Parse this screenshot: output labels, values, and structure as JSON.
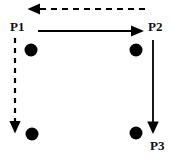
{
  "figure": {
    "background_color": "#ffffff",
    "stroke_color": "#000000",
    "width": 173,
    "height": 159
  },
  "labels": {
    "p1": "P1",
    "p2": "P2",
    "p3": "P3"
  },
  "nodes": [
    {
      "name": "node-top-left",
      "cx": 31,
      "cy": 50,
      "r": 6.5,
      "fill": "#000000"
    },
    {
      "name": "node-top-right",
      "cx": 136,
      "cy": 50,
      "r": 6.5,
      "fill": "#000000"
    },
    {
      "name": "node-bottom-left",
      "cx": 32,
      "cy": 134,
      "r": 6.5,
      "fill": "#000000"
    },
    {
      "name": "node-bottom-right",
      "cx": 136,
      "cy": 133,
      "r": 6.5,
      "fill": "#000000"
    }
  ],
  "arrows": [
    {
      "name": "arrow-top-dashed-left",
      "style": "dashed",
      "direction": "left",
      "from": [
        145,
        9
      ],
      "to": [
        29,
        9
      ]
    },
    {
      "name": "arrow-p1-to-p2-solid-right",
      "style": "solid",
      "direction": "right",
      "from": [
        38,
        31
      ],
      "to": [
        144,
        31
      ]
    },
    {
      "name": "arrow-left-dashed-down",
      "style": "dashed",
      "direction": "down",
      "from": [
        15,
        38
      ],
      "to": [
        15,
        133
      ]
    },
    {
      "name": "arrow-p2-to-p3-solid-down",
      "style": "solid",
      "direction": "down",
      "from": [
        153,
        40
      ],
      "to": [
        153,
        134
      ]
    }
  ]
}
